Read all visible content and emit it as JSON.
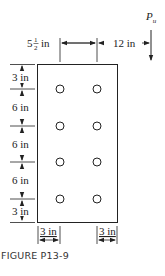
{
  "figure": {
    "caption": "FIGURE P13-9",
    "load_label": "P",
    "load_subscript": "u",
    "top_dims": {
      "left_whole": "5",
      "left_num": "1",
      "left_den": "2",
      "left_unit": "in",
      "right": "12 in"
    },
    "left_dims": [
      "3 in",
      "6 in",
      "6 in",
      "6 in",
      "3 in"
    ],
    "bottom_dims": [
      "3 in",
      "3 in"
    ],
    "bolt_grid": {
      "rows": 4,
      "cols": 2
    },
    "colors": {
      "line": "#222222",
      "background": "#ffffff"
    }
  }
}
